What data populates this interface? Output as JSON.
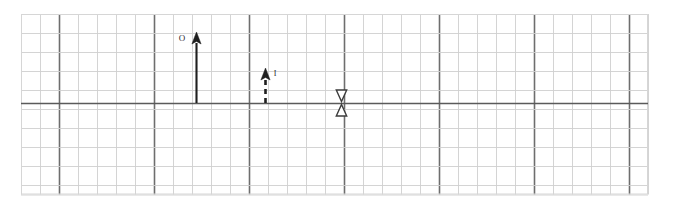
{
  "figure": {
    "title": "",
    "background_color": "#ffffff",
    "grid": {
      "x_start": 21,
      "y_start": 14,
      "columns": 33,
      "rows": 9.5,
      "cell_size": 19,
      "minor_color": "#cfcfcf",
      "major_color": "#6e6e6e",
      "border_color": "#d6d6d6",
      "major_every": 5,
      "major_offset": 2,
      "axis_color": "#5a5a5a",
      "axis_y": 103,
      "grid_on": true
    },
    "annotations": [
      {
        "name": "vector-O",
        "label": "O",
        "style": "solid",
        "direction": "up",
        "x": 196,
        "y_tail": 103,
        "y_head": 32,
        "color": "#1f1f1f",
        "label_x": 182,
        "label_y": 41
      },
      {
        "name": "vector-I",
        "label": "I",
        "style": "dashed",
        "direction": "up",
        "x": 265,
        "y_tail": 103,
        "y_head": 68,
        "color": "#1f1f1f",
        "label_x": 275,
        "label_y": 76
      },
      {
        "name": "marker-opposing-triangles",
        "label": "",
        "style": "hollow-double-triangle",
        "direction": "converging",
        "x": 341,
        "y_tail": 103,
        "y_head": 103,
        "color": "#3c3c3c",
        "label_x": 0,
        "label_y": 0
      }
    ]
  }
}
